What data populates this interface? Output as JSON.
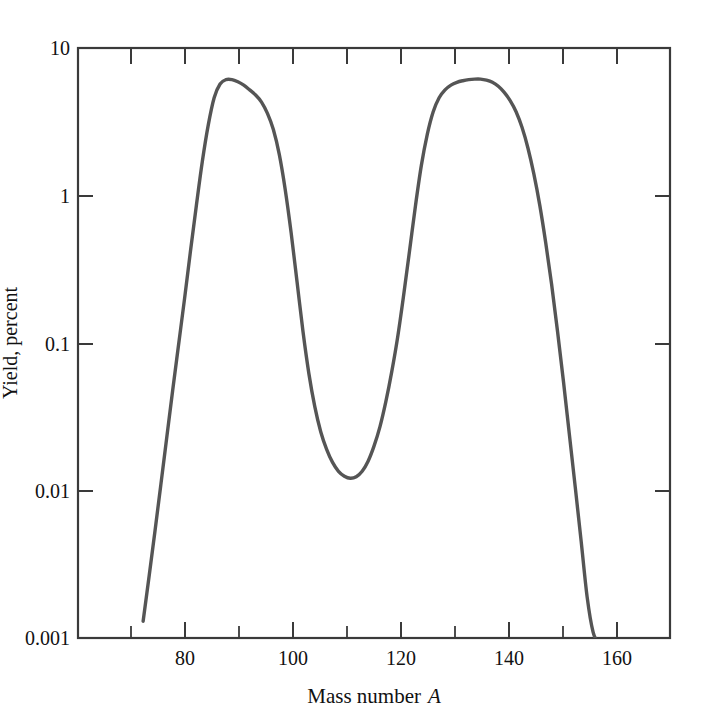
{
  "chart_data": {
    "type": "line",
    "title": "",
    "xlabel": "Mass number A",
    "ylabel": "Yield, percent",
    "xlim": [
      70,
      170
    ],
    "ylim": [
      0.001,
      10
    ],
    "yscale": "log",
    "xscale": "linear",
    "grid": false,
    "legend": null,
    "x_major_ticks": [
      80,
      100,
      120,
      140,
      160
    ],
    "x_minor_ticks": [
      90,
      110,
      130,
      150,
      170
    ],
    "x_tick_labels": [
      "80",
      "100",
      "120",
      "140",
      "160"
    ],
    "y_major_ticks": [
      10,
      1,
      0.1,
      0.01,
      0.001
    ],
    "y_tick_labels": [
      "10",
      "1",
      "0.1",
      "0.01",
      "0.001"
    ],
    "line_color": "#555555",
    "axis_color": "#333333",
    "series": [
      {
        "name": "Fission yield",
        "x": [
          81.0,
          82.0,
          83.0,
          84.0,
          85.0,
          86.0,
          87.0,
          88.0,
          89.0,
          90.0,
          91.0,
          92.0,
          93.0,
          94.0,
          95.0,
          96.0,
          97.0,
          98.0,
          99.0,
          100.0,
          101.0,
          102.0,
          103.0,
          104.0,
          105.0,
          106.0,
          107.0,
          108.0,
          109.0,
          110.0,
          111.0,
          112.0,
          113.0,
          114.0,
          115.0,
          116.0,
          117.0,
          118.0,
          119.0,
          120.0,
          121.0,
          122.0,
          123.0,
          124.0,
          125.0,
          126.0,
          127.0,
          128.0,
          129.0,
          130.0,
          131.0,
          132.0,
          133.0,
          134.0,
          135.0,
          136.0,
          137.0,
          138.0,
          139.0,
          140.0,
          141.0,
          142.0,
          143.0,
          144.0,
          145.0,
          146.0,
          147.0,
          148.0,
          149.0,
          150.0,
          151.0,
          152.0,
          153.0,
          154.0,
          155.0,
          156.0,
          157.0,
          158.0
        ],
        "y": [
          0.0013,
          0.0026,
          0.0053,
          0.011,
          0.023,
          0.048,
          0.098,
          0.2,
          0.42,
          0.86,
          1.7,
          3.0,
          4.6,
          5.7,
          6.1,
          6.1,
          5.9,
          5.6,
          5.2,
          4.8,
          4.3,
          3.6,
          2.8,
          1.9,
          1.1,
          0.56,
          0.26,
          0.12,
          0.062,
          0.037,
          0.025,
          0.019,
          0.0155,
          0.0135,
          0.0125,
          0.0121,
          0.0124,
          0.0135,
          0.0158,
          0.02,
          0.027,
          0.04,
          0.064,
          0.11,
          0.21,
          0.42,
          0.85,
          1.6,
          2.6,
          3.7,
          4.6,
          5.2,
          5.6,
          5.85,
          6.0,
          6.1,
          6.15,
          6.15,
          6.05,
          5.85,
          5.5,
          5.0,
          4.4,
          3.7,
          2.9,
          2.1,
          1.4,
          0.86,
          0.48,
          0.25,
          0.12,
          0.055,
          0.024,
          0.0105,
          0.0045,
          0.0019,
          0.0011,
          0.0009
        ]
      }
    ],
    "annotations": {
      "left_peak": {
        "x": 95,
        "y": 6.1
      },
      "right_peak": {
        "x": 138,
        "y": 6.15
      },
      "valley_min": {
        "x": 116,
        "y": 0.0121
      }
    }
  },
  "axes": {
    "y_title": "Yield, percent",
    "x_title_main": "Mass  number",
    "x_title_var": "A"
  }
}
